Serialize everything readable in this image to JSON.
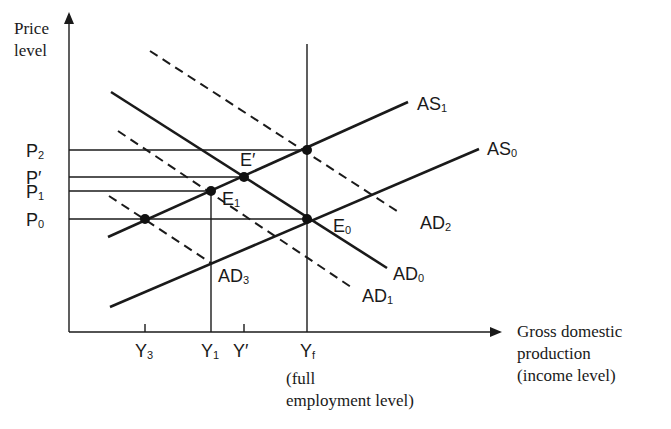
{
  "diagram": {
    "type": "aggregate-demand-aggregate-supply",
    "y_axis_label": [
      "Price",
      "level"
    ],
    "x_axis_label": [
      "Gross domestic",
      "production",
      "(income level)"
    ],
    "price_ticks": [
      {
        "base": "P",
        "sub": "2",
        "key": "P2"
      },
      {
        "base": "P′",
        "sub": "",
        "key": "Pprime"
      },
      {
        "base": "P",
        "sub": "1",
        "key": "P1"
      },
      {
        "base": "P",
        "sub": "0",
        "key": "P0"
      }
    ],
    "income_ticks": [
      {
        "base": "Y",
        "sub": "3",
        "key": "Y3"
      },
      {
        "base": "Y",
        "sub": "1",
        "key": "Y1"
      },
      {
        "base": "Y′",
        "sub": "",
        "key": "Yprime"
      },
      {
        "base": "Y",
        "sub": "f",
        "key": "Yf"
      }
    ],
    "yf_note": [
      "(full",
      "employment level)"
    ],
    "curves": [
      {
        "key": "AS1",
        "base": "AS",
        "sub": "1",
        "style": "solid"
      },
      {
        "key": "AS0",
        "base": "AS",
        "sub": "0",
        "style": "solid"
      },
      {
        "key": "AD0",
        "base": "AD",
        "sub": "0",
        "style": "solid"
      },
      {
        "key": "AD1",
        "base": "AD",
        "sub": "1",
        "style": "dashed"
      },
      {
        "key": "AD2",
        "base": "AD",
        "sub": "2",
        "style": "dashed"
      },
      {
        "key": "AD3",
        "base": "AD",
        "sub": "3",
        "style": "dashed"
      }
    ],
    "equilibria": [
      {
        "key": "E0",
        "base": "E",
        "sub": "0",
        "at": [
          "Yf",
          "P0"
        ]
      },
      {
        "key": "E1",
        "base": "E",
        "sub": "1",
        "at": [
          "Y1",
          "P1"
        ]
      },
      {
        "key": "Eprime",
        "base": "E′",
        "sub": "",
        "at": [
          "Yprime",
          "Pprime"
        ]
      },
      {
        "key": "EYfP2",
        "base": "",
        "sub": "",
        "at": [
          "Yf",
          "P2"
        ]
      },
      {
        "key": "EY3P0",
        "base": "",
        "sub": "",
        "at": [
          "Y3",
          "P0"
        ]
      }
    ]
  }
}
